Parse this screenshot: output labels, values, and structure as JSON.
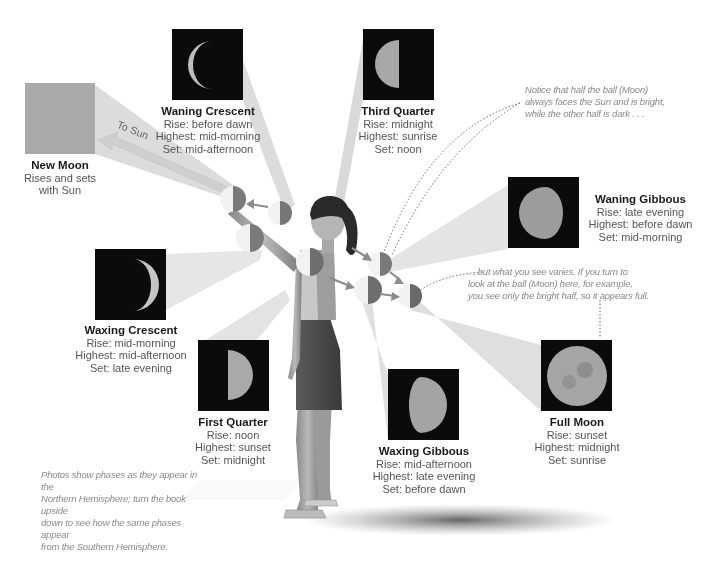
{
  "diagram": {
    "type": "moon-phases-illustration",
    "to_sun_label": "To Sun",
    "phases": [
      {
        "id": "new-moon",
        "name": "New Moon",
        "lines": [
          "Rises and sets",
          "with Sun"
        ]
      },
      {
        "id": "waning-crescent",
        "name": "Waning Crescent",
        "lines": [
          "Rise: before dawn",
          "Highest: mid-morning",
          "Set: mid-afternoon"
        ]
      },
      {
        "id": "third-quarter",
        "name": "Third Quarter",
        "lines": [
          "Rise: midnight",
          "Highest: sunrise",
          "Set: noon"
        ]
      },
      {
        "id": "waning-gibbous",
        "name": "Waning Gibbous",
        "lines": [
          "Rise: late evening",
          "Highest: before dawn",
          "Set: mid-morning"
        ]
      },
      {
        "id": "waxing-crescent",
        "name": "Waxing Crescent",
        "lines": [
          "Rise: mid-morning",
          "Highest: mid-afternoon",
          "Set: late evening"
        ]
      },
      {
        "id": "first-quarter",
        "name": "First Quarter",
        "lines": [
          "Rise: noon",
          "Highest: sunset",
          "Set: midnight"
        ]
      },
      {
        "id": "waxing-gibbous",
        "name": "Waxing Gibbous",
        "lines": [
          "Rise: mid-afternoon",
          "Highest: late evening",
          "Set: before dawn"
        ]
      },
      {
        "id": "full-moon",
        "name": "Full Moon",
        "lines": [
          "Rise: sunset",
          "Highest: midnight",
          "Set: sunrise"
        ]
      }
    ],
    "notes": {
      "top_right": [
        "Notice that half the ball (Moon)",
        "always faces the Sun and is bright,",
        "while the other half is dark . . ."
      ],
      "middle_right": [
        ". . but what you see varies. If you turn to",
        "look at the ball (Moon) here, for example,",
        "you see only the bright half, so it appears full."
      ],
      "bottom_left": [
        "Photos show phases as they appear in the",
        "Northern Hemisphere; turn the book upside",
        "down to see how the same phases appear",
        "from the Southern Hemisphere."
      ]
    },
    "colors": {
      "photo_bg": "#0b0b0b",
      "new_moon_box": "#a9a9a9",
      "beam": "#d9d9d9",
      "ball_light": "#f2f2f2",
      "ball_dark": "#7a7a7a",
      "arrow": "#8c8c8c",
      "note_text": "#8a8a8a"
    }
  }
}
